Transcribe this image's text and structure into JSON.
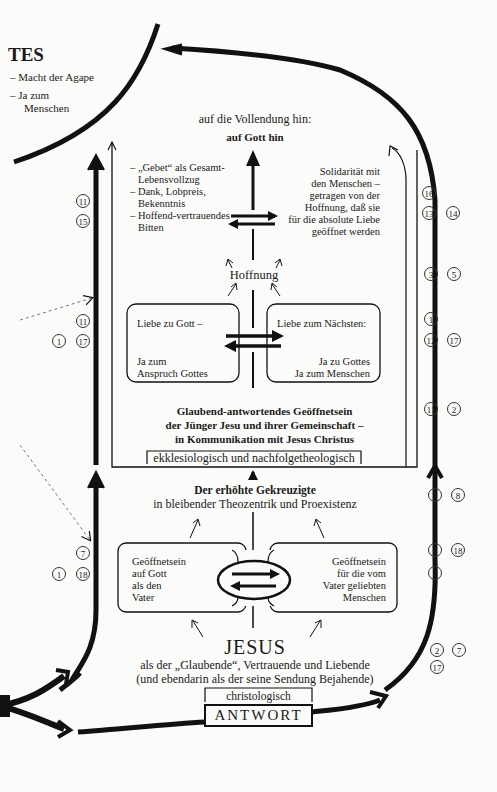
{
  "top_left": {
    "title": "TES",
    "items": [
      "– Macht der Agape",
      "– Ja zum",
      "Menschen"
    ]
  },
  "top": {
    "goal": "auf die Vollendung hin:",
    "goal_bold": "auf Gott hin"
  },
  "prayer_list": [
    "– „Gebet“ als Gesamt-",
    "Lebensvollzug",
    "– Dank, Lobpreis,",
    "Bekenntnis",
    "– Hoffend-vertrauendes",
    "Bitten"
  ],
  "solidarity": [
    "Solidarität mit",
    "den Menschen –",
    "getragen von der",
    "Hoffnung, daß sie",
    "für die absolute Liebe",
    "geöffnet werden"
  ],
  "hope": "Hoffnung",
  "love_god": {
    "line1": "Liebe zu Gott –",
    "line2": "Ja zum",
    "line3": "Anspruch Gottes"
  },
  "love_neighbor": {
    "line1": "Liebe zum Nächsten:",
    "line2": "Ja zu Gottes",
    "line3": "Ja zum Menschen"
  },
  "community": {
    "lines": [
      "Glaubend-antwortendes Geöffnetsein",
      "der Jünger Jesu und ihrer Gemeinschaft –",
      "in Kommunikation mit Jesus Christus"
    ],
    "label": "ekklesiologisch und nachfolgetheologisch"
  },
  "exalted": {
    "bold": "Der erhöhte Gekreuzigte",
    "sub": "in bleibender Theozentrik und Proexistenz"
  },
  "open_god": [
    "Geöffnetsein",
    "auf Gott",
    "als den",
    "Vater"
  ],
  "open_people": [
    "Geöffnetsein",
    "für die vom",
    "Vater geliebten",
    "Menschen"
  ],
  "jesus": {
    "name": "JESUS",
    "line1": "als der „Glaubende“, Vertrauende und Liebende",
    "line2": "(und ebendarin als der seine Sendung Bejahende)",
    "label": "christologisch",
    "answer": "ANTWORT"
  },
  "refs": {
    "left": [
      [
        "11"
      ],
      [
        "15"
      ],
      [
        "11"
      ],
      [
        "1",
        "17"
      ],
      [
        "7"
      ],
      [
        "1",
        "18"
      ]
    ],
    "right": [
      [
        "16"
      ],
      [
        "13",
        "14"
      ],
      [
        "3",
        "5"
      ],
      [
        "1"
      ],
      [
        "12",
        "17"
      ],
      [
        "11",
        "2"
      ],
      [
        "7",
        "8"
      ],
      [
        "8",
        "18"
      ],
      [
        "1"
      ],
      [
        "2",
        "7"
      ],
      [
        "17"
      ]
    ]
  }
}
